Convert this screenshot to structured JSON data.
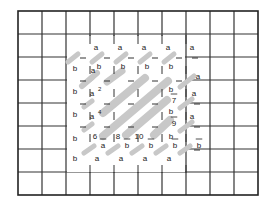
{
  "diagram": {
    "grid": {
      "x0": 18,
      "y0": 11,
      "cols": 10,
      "rows": 8,
      "cell_w": 24,
      "cell_h": 23,
      "line_color": "#333333",
      "stripe_color": "#c8c8c8",
      "cleared_region": {
        "x1": 66,
        "y1": 35,
        "x2": 186,
        "y2": 173
      }
    },
    "stripes": [
      {
        "x1": 68,
        "y1": 62,
        "x2": 78,
        "y2": 54,
        "w": 5
      },
      {
        "x1": 92,
        "y1": 62,
        "x2": 102,
        "y2": 54,
        "w": 5
      },
      {
        "x1": 116,
        "y1": 62,
        "x2": 126,
        "y2": 54,
        "w": 5
      },
      {
        "x1": 140,
        "y1": 62,
        "x2": 150,
        "y2": 54,
        "w": 5
      },
      {
        "x1": 164,
        "y1": 62,
        "x2": 174,
        "y2": 54,
        "w": 5
      },
      {
        "x1": 82,
        "y1": 86,
        "x2": 97,
        "y2": 73,
        "w": 6
      },
      {
        "x1": 107,
        "y1": 82,
        "x2": 122,
        "y2": 71,
        "w": 7
      },
      {
        "x1": 103,
        "y1": 113,
        "x2": 145,
        "y2": 78,
        "w": 8
      },
      {
        "x1": 103,
        "y1": 136,
        "x2": 168,
        "y2": 81,
        "w": 8
      },
      {
        "x1": 126,
        "y1": 135,
        "x2": 167,
        "y2": 100,
        "w": 8
      },
      {
        "x1": 154,
        "y1": 135,
        "x2": 170,
        "y2": 120,
        "w": 8
      },
      {
        "x1": 180,
        "y1": 87,
        "x2": 194,
        "y2": 76,
        "w": 5
      },
      {
        "x1": 180,
        "y1": 108,
        "x2": 192,
        "y2": 99,
        "w": 5
      },
      {
        "x1": 180,
        "y1": 131,
        "x2": 192,
        "y2": 122,
        "w": 5
      },
      {
        "x1": 84,
        "y1": 84,
        "x2": 92,
        "y2": 78,
        "w": 5
      },
      {
        "x1": 84,
        "y1": 107,
        "x2": 92,
        "y2": 101,
        "w": 5
      },
      {
        "x1": 84,
        "y1": 130,
        "x2": 92,
        "y2": 124,
        "w": 5
      },
      {
        "x1": 84,
        "y1": 153,
        "x2": 94,
        "y2": 146,
        "w": 5
      },
      {
        "x1": 108,
        "y1": 153,
        "x2": 118,
        "y2": 146,
        "w": 5
      },
      {
        "x1": 132,
        "y1": 153,
        "x2": 142,
        "y2": 146,
        "w": 5
      },
      {
        "x1": 156,
        "y1": 153,
        "x2": 166,
        "y2": 146,
        "w": 5
      },
      {
        "x1": 180,
        "y1": 153,
        "x2": 190,
        "y2": 146,
        "w": 5
      }
    ],
    "labels": [
      {
        "text": "a",
        "x": 96,
        "y": 50
      },
      {
        "text": "a",
        "x": 120,
        "y": 50
      },
      {
        "text": "a",
        "x": 144,
        "y": 50
      },
      {
        "text": "a",
        "x": 168,
        "y": 50
      },
      {
        "text": "a",
        "x": 192,
        "y": 50
      },
      {
        "text": "b",
        "x": 75,
        "y": 71
      },
      {
        "text": "a",
        "x": 93,
        "y": 73
      },
      {
        "text": "b",
        "x": 99,
        "y": 69
      },
      {
        "text": "b",
        "x": 123,
        "y": 69
      },
      {
        "text": "b",
        "x": 147,
        "y": 69
      },
      {
        "text": "b",
        "x": 171,
        "y": 69
      },
      {
        "text": "a",
        "x": 198,
        "y": 79
      },
      {
        "text": "b",
        "x": 75,
        "y": 94
      },
      {
        "text": "a",
        "x": 92,
        "y": 96
      },
      {
        "text": "b",
        "x": 171,
        "y": 92
      },
      {
        "text": "a",
        "x": 194,
        "y": 96
      },
      {
        "text": "7",
        "x": 174,
        "y": 103,
        "underline": true
      },
      {
        "text": "b",
        "x": 75,
        "y": 117
      },
      {
        "text": "a",
        "x": 92,
        "y": 119
      },
      {
        "text": "b",
        "x": 171,
        "y": 114
      },
      {
        "text": "a",
        "x": 192,
        "y": 119
      },
      {
        "text": "9",
        "x": 174,
        "y": 126,
        "underline": true
      },
      {
        "text": "b",
        "x": 75,
        "y": 141
      },
      {
        "text": "6",
        "x": 95,
        "y": 139
      },
      {
        "text": "8",
        "x": 118,
        "y": 139
      },
      {
        "text": "10",
        "x": 139,
        "y": 139
      },
      {
        "text": "b",
        "x": 171,
        "y": 139
      },
      {
        "text": "a",
        "x": 103,
        "y": 148,
        "underline": true
      },
      {
        "text": "b",
        "x": 127,
        "y": 148,
        "underline": true
      },
      {
        "text": "b",
        "x": 151,
        "y": 148,
        "underline": true
      },
      {
        "text": "b",
        "x": 175,
        "y": 148,
        "underline": true
      },
      {
        "text": "b",
        "x": 199,
        "y": 148,
        "underline": true
      },
      {
        "text": "b",
        "x": 75,
        "y": 161
      },
      {
        "text": "a",
        "x": 97,
        "y": 161
      },
      {
        "text": "a",
        "x": 121,
        "y": 161
      },
      {
        "text": "a",
        "x": 145,
        "y": 161
      },
      {
        "text": "a",
        "x": 169,
        "y": 161
      }
    ],
    "superscripts": [
      {
        "text": "2",
        "x": 98,
        "y": 91
      },
      {
        "text": "4",
        "x": 98,
        "y": 114
      }
    ],
    "ticks": [
      {
        "x1": 90,
        "y1": 66,
        "x2": 90,
        "y2": 74
      },
      {
        "x1": 90,
        "y1": 89,
        "x2": 90,
        "y2": 97
      },
      {
        "x1": 90,
        "y1": 112,
        "x2": 90,
        "y2": 120
      },
      {
        "x1": 90,
        "y1": 134,
        "x2": 90,
        "y2": 142
      },
      {
        "x1": 114,
        "y1": 66,
        "x2": 114,
        "y2": 74
      },
      {
        "x1": 114,
        "y1": 89,
        "x2": 114,
        "y2": 97
      },
      {
        "x1": 114,
        "y1": 112,
        "x2": 114,
        "y2": 120
      },
      {
        "x1": 114,
        "y1": 134,
        "x2": 114,
        "y2": 142
      },
      {
        "x1": 138,
        "y1": 66,
        "x2": 138,
        "y2": 74
      },
      {
        "x1": 138,
        "y1": 89,
        "x2": 138,
        "y2": 97
      },
      {
        "x1": 138,
        "y1": 134,
        "x2": 138,
        "y2": 142
      },
      {
        "x1": 162,
        "y1": 66,
        "x2": 162,
        "y2": 74
      },
      {
        "x1": 162,
        "y1": 89,
        "x2": 162,
        "y2": 97
      },
      {
        "x1": 162,
        "y1": 112,
        "x2": 162,
        "y2": 120
      },
      {
        "x1": 162,
        "y1": 134,
        "x2": 162,
        "y2": 142
      },
      {
        "x1": 186,
        "y1": 66,
        "x2": 186,
        "y2": 74
      },
      {
        "x1": 186,
        "y1": 89,
        "x2": 186,
        "y2": 97
      },
      {
        "x1": 186,
        "y1": 112,
        "x2": 186,
        "y2": 120
      },
      {
        "x1": 186,
        "y1": 134,
        "x2": 186,
        "y2": 142
      },
      {
        "x1": 90,
        "y1": 35,
        "x2": 90,
        "y2": 44
      },
      {
        "x1": 114,
        "y1": 35,
        "x2": 114,
        "y2": 44
      },
      {
        "x1": 138,
        "y1": 35,
        "x2": 138,
        "y2": 44
      },
      {
        "x1": 162,
        "y1": 35,
        "x2": 162,
        "y2": 44
      },
      {
        "x1": 186,
        "y1": 35,
        "x2": 186,
        "y2": 44
      },
      {
        "x1": 90,
        "y1": 165,
        "x2": 90,
        "y2": 173
      },
      {
        "x1": 114,
        "y1": 165,
        "x2": 114,
        "y2": 173
      },
      {
        "x1": 138,
        "y1": 165,
        "x2": 138,
        "y2": 173
      },
      {
        "x1": 162,
        "y1": 165,
        "x2": 162,
        "y2": 173
      },
      {
        "x1": 186,
        "y1": 165,
        "x2": 186,
        "y2": 173
      },
      {
        "x1": 80,
        "y1": 58,
        "x2": 86,
        "y2": 58
      },
      {
        "x1": 104,
        "y1": 58,
        "x2": 110,
        "y2": 58
      },
      {
        "x1": 128,
        "y1": 58,
        "x2": 134,
        "y2": 58
      },
      {
        "x1": 152,
        "y1": 58,
        "x2": 158,
        "y2": 58
      },
      {
        "x1": 176,
        "y1": 58,
        "x2": 182,
        "y2": 58
      },
      {
        "x1": 192,
        "y1": 58,
        "x2": 198,
        "y2": 58
      },
      {
        "x1": 80,
        "y1": 81,
        "x2": 86,
        "y2": 81
      },
      {
        "x1": 104,
        "y1": 81,
        "x2": 110,
        "y2": 81
      },
      {
        "x1": 128,
        "y1": 81,
        "x2": 134,
        "y2": 81
      },
      {
        "x1": 152,
        "y1": 81,
        "x2": 158,
        "y2": 81
      },
      {
        "x1": 176,
        "y1": 81,
        "x2": 182,
        "y2": 81
      },
      {
        "x1": 80,
        "y1": 104,
        "x2": 86,
        "y2": 104
      },
      {
        "x1": 104,
        "y1": 104,
        "x2": 110,
        "y2": 104
      },
      {
        "x1": 128,
        "y1": 104,
        "x2": 134,
        "y2": 104
      },
      {
        "x1": 152,
        "y1": 104,
        "x2": 158,
        "y2": 104
      },
      {
        "x1": 80,
        "y1": 127,
        "x2": 86,
        "y2": 127
      },
      {
        "x1": 104,
        "y1": 127,
        "x2": 110,
        "y2": 127
      },
      {
        "x1": 128,
        "y1": 127,
        "x2": 134,
        "y2": 127
      },
      {
        "x1": 152,
        "y1": 127,
        "x2": 158,
        "y2": 127
      },
      {
        "x1": 194,
        "y1": 104,
        "x2": 200,
        "y2": 104
      },
      {
        "x1": 194,
        "y1": 127,
        "x2": 200,
        "y2": 127
      },
      {
        "x1": 194,
        "y1": 150,
        "x2": 200,
        "y2": 150
      }
    ]
  }
}
